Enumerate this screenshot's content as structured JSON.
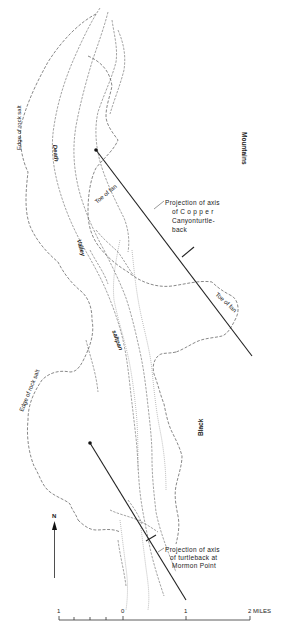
{
  "figure": {
    "labels": {
      "edge_rock_salt_north": "Edge of rock salt",
      "edge_rock_salt_south": "Edge of rock salt",
      "death": "Death",
      "valley": "Valley",
      "saltpan": "saltpan",
      "mountains": "Mountains",
      "black": "Black",
      "toe_of_fan_west": "Toe of fan",
      "toe_of_fan_east": "Toe of fan"
    },
    "annotations": {
      "copper_canyon": [
        "Projection of axis",
        "of  C o p p e r",
        "Canyonturtle-",
        "back"
      ],
      "mormon_point": [
        "Projection of axis",
        "of turtleback at",
        "Mormon Point"
      ]
    },
    "north_arrow": {
      "label": "N"
    },
    "scale_bar": {
      "ticks": [
        "1",
        "0",
        "1",
        "2 MILES"
      ],
      "unit": "MILES"
    }
  }
}
